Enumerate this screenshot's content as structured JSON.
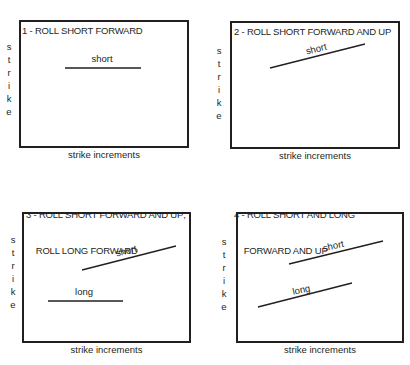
{
  "diagram": {
    "y_axis_label": "strike",
    "x_axis_label": "strike increments",
    "line_color": "#231f20",
    "panels": [
      {
        "id": 1,
        "title_lines": [
          "1 - ROLL SHORT FORWARD"
        ],
        "lines": [
          {
            "label": "short",
            "direction": "horizontal"
          }
        ]
      },
      {
        "id": 2,
        "title_lines": [
          "2 - ROLL SHORT FORWARD AND UP"
        ],
        "lines": [
          {
            "label": "short",
            "direction": "upward"
          }
        ]
      },
      {
        "id": 3,
        "title_lines": [
          "3 - ROLL SHORT FORWARD AND UP;",
          "    ROLL LONG FORWARD"
        ],
        "lines": [
          {
            "label": "short",
            "direction": "upward"
          },
          {
            "label": "long",
            "direction": "horizontal"
          }
        ]
      },
      {
        "id": 4,
        "title_lines": [
          "4 - ROLL SHORT AND LONG",
          "    FORWARD AND UP"
        ],
        "lines": [
          {
            "label": "short",
            "direction": "upward"
          },
          {
            "label": "long",
            "direction": "upward"
          }
        ]
      }
    ]
  }
}
